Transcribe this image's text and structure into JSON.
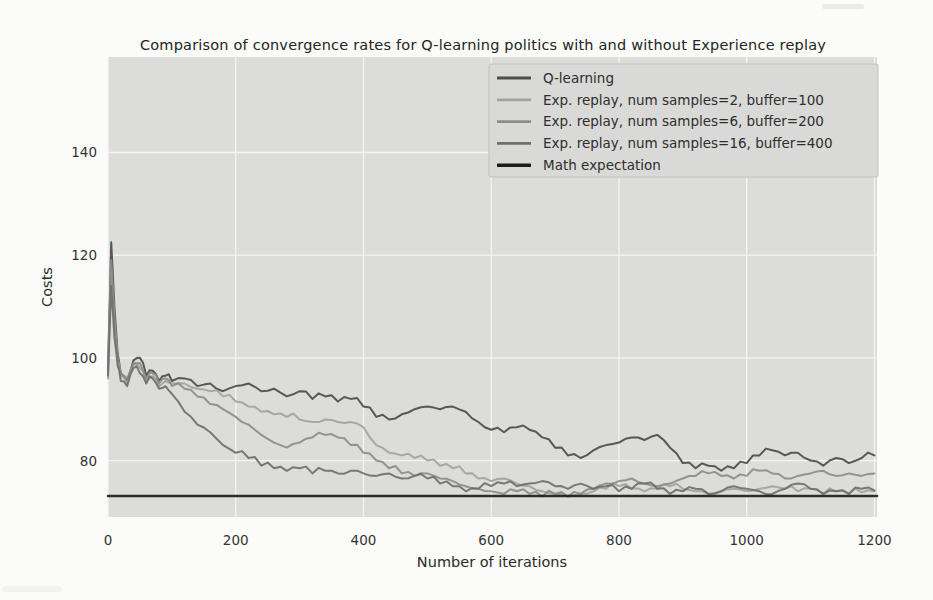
{
  "figure": {
    "title": "Comparison of convergence rates for Q-learning politics with and without Experience replay"
  },
  "chart_data": {
    "type": "line",
    "title": "Comparison of convergence rates for Q-learning politics with and without Experience replay",
    "xlabel": "Number of iterations",
    "ylabel": "Costs",
    "xlim": [
      0,
      1204
    ],
    "ylim": [
      69,
      158.6
    ],
    "xticks": [
      0,
      200,
      400,
      600,
      800,
      1000,
      1200
    ],
    "yticks": [
      80,
      100,
      120,
      140
    ],
    "grid": true,
    "grid_color": "#f4f4f1",
    "plot_background": "#dcdcda",
    "legend_position": "upper right",
    "legend_background": "#d9d9d7",
    "legend_border": "#c2c2c0",
    "math_expectation_value": 73.1,
    "x": [
      0,
      5,
      10,
      15,
      20,
      30,
      40,
      50,
      60,
      70,
      80,
      90,
      100,
      120,
      140,
      160,
      180,
      200,
      220,
      240,
      260,
      280,
      300,
      320,
      340,
      360,
      380,
      400,
      420,
      440,
      460,
      480,
      500,
      520,
      540,
      560,
      580,
      600,
      620,
      640,
      660,
      680,
      700,
      720,
      740,
      760,
      780,
      800,
      820,
      840,
      860,
      880,
      900,
      920,
      940,
      960,
      980,
      1000,
      1020,
      1040,
      1060,
      1080,
      1100,
      1120,
      1140,
      1160,
      1180,
      1200
    ],
    "series": [
      {
        "name": "Q-learning",
        "color": "#4d4d4d",
        "width": 2,
        "values": [
          98,
          122.5,
          110,
          101,
          97,
          95.5,
          99.5,
          100,
          96.5,
          97.5,
          95.5,
          96.5,
          95.5,
          96,
          94.5,
          95,
          93.5,
          94.5,
          95,
          93.5,
          94,
          92.5,
          93.5,
          92,
          92.5,
          91.5,
          92,
          90.5,
          88.5,
          88,
          89,
          90,
          90.5,
          90,
          90.5,
          89.5,
          87.5,
          86,
          85.5,
          86.5,
          86,
          84.5,
          82.5,
          81,
          80.5,
          82,
          83,
          83.5,
          84.5,
          84,
          85,
          82.5,
          79.5,
          78.5,
          79,
          78,
          78.5,
          79.5,
          81,
          82,
          81,
          81.5,
          80,
          79,
          80.5,
          79.5,
          80.5,
          81
        ]
      },
      {
        "name": "Exp. replay, num samples=2, buffer=100",
        "color": "#a2a2a0",
        "width": 2,
        "values": [
          96,
          117,
          106,
          99.5,
          96.5,
          95,
          98.5,
          98,
          95.5,
          96.5,
          94.5,
          95.5,
          95,
          95,
          94,
          93.5,
          92.5,
          91.5,
          90.5,
          89.5,
          89,
          88.5,
          88,
          87.5,
          88,
          87.5,
          87.5,
          86.5,
          83,
          81.5,
          81,
          80.5,
          80,
          79,
          78.5,
          77.5,
          76.5,
          76,
          76.5,
          75.5,
          75,
          74,
          73.5,
          73,
          73.5,
          74,
          74.5,
          75,
          74.5,
          74,
          74.5,
          75,
          74.5,
          74,
          73.5,
          74,
          74.5,
          74,
          74.5,
          75,
          74.5,
          74,
          74.5,
          73.5,
          74,
          73.5,
          73.8,
          74
        ]
      },
      {
        "name": "Exp. replay, num samples=6, buffer=200",
        "color": "#8c8c8a",
        "width": 2,
        "values": [
          97,
          119,
          108,
          100,
          97,
          96,
          99,
          99,
          96,
          97,
          95,
          96,
          94.5,
          94,
          92.5,
          91,
          90,
          88.5,
          87,
          85,
          83.5,
          82.5,
          83.5,
          84.5,
          85,
          84.5,
          83,
          81.5,
          80,
          78.5,
          77.5,
          77,
          77.5,
          76.5,
          76,
          75,
          74.5,
          74,
          73.5,
          74,
          73.5,
          73,
          73.5,
          73,
          73.5,
          74.5,
          75.5,
          76,
          76.5,
          75.5,
          75,
          75.5,
          76.5,
          77,
          77.5,
          77,
          76.5,
          77,
          78,
          77.5,
          76.5,
          77,
          77.5,
          78,
          77,
          77.5,
          77,
          77.5
        ]
      },
      {
        "name": "Exp. replay, num samples=16, buffer=400",
        "color": "#6f6f6d",
        "width": 2,
        "values": [
          96.5,
          114,
          104,
          98.5,
          95.5,
          94.5,
          98,
          97,
          95,
          96,
          94,
          94.5,
          93,
          89.5,
          87,
          85.5,
          83,
          81.5,
          80.5,
          79,
          78.5,
          78,
          78.5,
          77.5,
          78,
          77.5,
          78,
          77.5,
          77,
          77.5,
          76.5,
          77,
          76.5,
          75.5,
          75,
          74,
          74.5,
          75,
          75.5,
          75,
          75.5,
          76,
          75,
          74.5,
          75.5,
          74.5,
          75,
          74,
          74.5,
          75.5,
          74.5,
          73.5,
          74,
          74.5,
          73.5,
          74,
          75,
          74.5,
          74,
          73.5,
          74.5,
          75.5,
          74.5,
          73.5,
          74,
          73.5,
          74.5,
          74.2
        ]
      },
      {
        "name": "Math expectation",
        "color": "#1c1c1c",
        "width": 2.6,
        "x": [
          0,
          1204
        ],
        "values": [
          73.1,
          73.1
        ]
      }
    ]
  }
}
